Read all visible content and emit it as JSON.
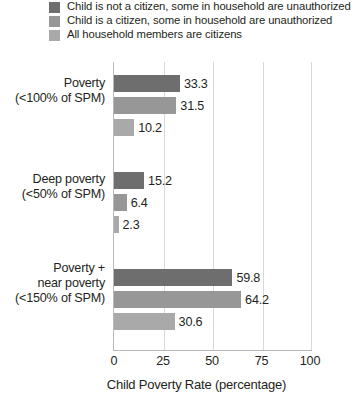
{
  "chart_data": {
    "type": "bar",
    "orientation": "horizontal",
    "title": "",
    "xlabel": "Child Poverty Rate (percentage)",
    "ylabel": "",
    "xlim": [
      0,
      100
    ],
    "xticks": [
      0,
      25,
      50,
      75,
      100
    ],
    "xtick_labels": [
      "0",
      "25",
      "50",
      "75",
      "100"
    ],
    "grid": true,
    "grid_axis": "x",
    "legend_position": "top",
    "categories": [
      "Poverty\n(<100% of SPM)",
      "Deep poverty\n(<50% of SPM)",
      "Poverty +\nnear poverty\n(<150% of SPM)"
    ],
    "category_lines": [
      [
        "Poverty",
        "(<100% of SPM)"
      ],
      [
        "Deep poverty",
        "(<50% of SPM)"
      ],
      [
        "Poverty +",
        "near poverty",
        "(<150% of SPM)"
      ]
    ],
    "series": [
      {
        "name": "Child is not a citizen, some in household are unauthorized",
        "color": "#6e6e6e",
        "values": [
          33.3,
          15.2,
          59.8
        ],
        "value_labels": [
          "33.3",
          "15.2",
          "59.8"
        ]
      },
      {
        "name": "Child is a citizen, some in household are unauthorized",
        "color": "#979797",
        "values": [
          31.5,
          6.4,
          64.2
        ],
        "value_labels": [
          "31.5",
          "6.4",
          "64.2"
        ]
      },
      {
        "name": "All household members are citizens",
        "color": "#a9a9a9",
        "values": [
          10.2,
          2.3,
          30.6
        ],
        "value_labels": [
          "10.2",
          "6.4",
          "30.6"
        ]
      }
    ]
  },
  "legend": {
    "items": [
      {
        "label": "Child is not a citizen, some in household are unauthorized",
        "color": "#6e6e6e"
      },
      {
        "label": "Child is a citizen, some in household are unauthorized",
        "color": "#979797"
      },
      {
        "label": "All household members are citizens",
        "color": "#a9a9a9"
      }
    ]
  },
  "axis": {
    "x_title": "Child Poverty Rate (percentage)",
    "ticks": [
      "0",
      "25",
      "50",
      "75",
      "100"
    ]
  },
  "groups": [
    {
      "label_lines": [
        "Poverty",
        "(<100% of SPM)"
      ],
      "bars": [
        {
          "value": 33.3,
          "label": "33.3",
          "color": "#6e6e6e"
        },
        {
          "value": 31.5,
          "label": "31.5",
          "color": "#979797"
        },
        {
          "value": 10.2,
          "label": "10.2",
          "color": "#a9a9a9"
        }
      ]
    },
    {
      "label_lines": [
        "Deep poverty",
        "(<50% of SPM)"
      ],
      "bars": [
        {
          "value": 15.2,
          "label": "15.2",
          "color": "#6e6e6e"
        },
        {
          "value": 6.4,
          "label": "6.4",
          "color": "#979797"
        },
        {
          "value": 2.3,
          "label": "2.3",
          "color": "#a9a9a9"
        }
      ]
    },
    {
      "label_lines": [
        "Poverty +",
        "near poverty",
        "(<150% of SPM)"
      ],
      "bars": [
        {
          "value": 59.8,
          "label": "59.8",
          "color": "#6e6e6e"
        },
        {
          "value": 64.2,
          "label": "64.2",
          "color": "#979797"
        },
        {
          "value": 30.6,
          "label": "30.6",
          "color": "#a9a9a9"
        }
      ]
    }
  ],
  "colors": {
    "series_dark": "#6e6e6e",
    "series_medium": "#979797",
    "series_light": "#a9a9a9",
    "gridline": "#d8d8d8",
    "axis": "#b9b9b9",
    "text": "#231f20",
    "background": "#ffffff"
  }
}
